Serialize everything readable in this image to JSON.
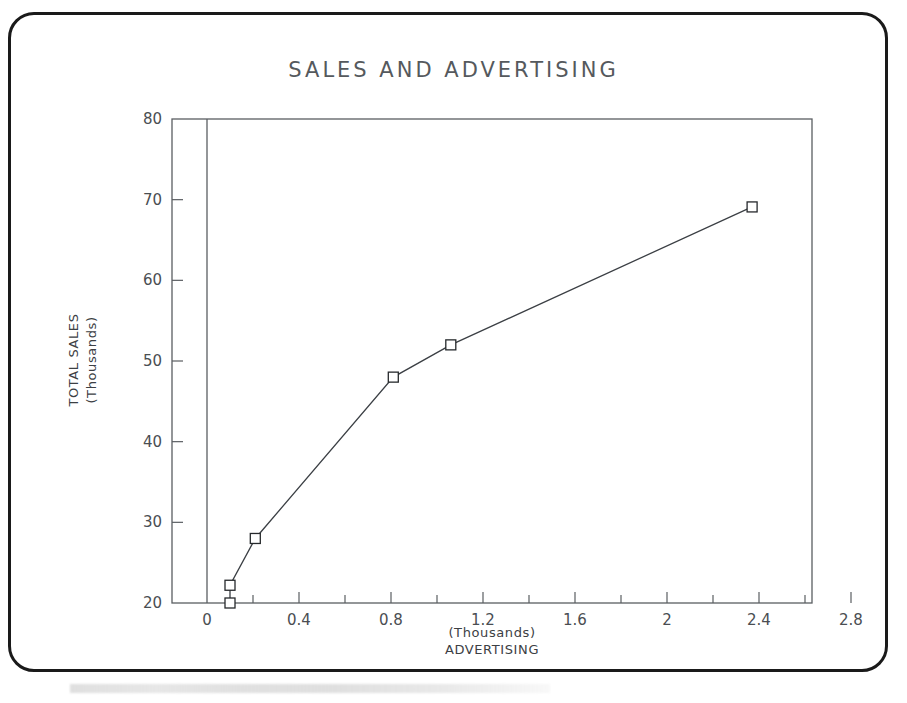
{
  "chart_data": {
    "type": "line",
    "title": "SALES AND ADVERTISING",
    "xlabel": "ADVERTISING",
    "xlabel_units": "(Thousands)",
    "ylabel": "TOTAL SALES",
    "ylabel_units": "(Thousands)",
    "xlim": [
      0,
      2.87
    ],
    "ylim": [
      20,
      80
    ],
    "x_major_ticks": [
      0,
      0.4,
      0.8,
      1.2,
      1.6,
      2,
      2.4,
      2.8
    ],
    "x_major_tick_labels": [
      "0",
      "0.4",
      "0.8",
      "1.2",
      "1.6",
      "2",
      "2.4",
      "2.8"
    ],
    "x_minor_ticks": [
      0.2,
      0.6,
      1.0,
      1.4,
      1.8,
      2.2,
      2.6
    ],
    "y_major_ticks": [
      20,
      30,
      40,
      50,
      60,
      70,
      80
    ],
    "y_major_tick_labels": [
      "20",
      "30",
      "40",
      "50",
      "60",
      "70",
      "80"
    ],
    "grid": false,
    "legend": "none",
    "marker": "open-square",
    "series": [
      {
        "name": "Total Sales",
        "x": [
          0.1,
          0.1,
          0.21,
          0.81,
          1.06,
          2.37
        ],
        "y": [
          20.0,
          22.2,
          28.0,
          48.0,
          52.0,
          69.1
        ],
        "points": [
          {
            "x": 0.1,
            "y": 20.0
          },
          {
            "x": 0.1,
            "y": 22.2
          },
          {
            "x": 0.21,
            "y": 28.0
          },
          {
            "x": 0.81,
            "y": 48.0
          },
          {
            "x": 1.06,
            "y": 52.0
          },
          {
            "x": 2.37,
            "y": 69.1
          }
        ]
      }
    ],
    "colors": {
      "line": "#3b3f44",
      "marker_fill": "#ffffff",
      "marker_stroke": "#26292c",
      "axis": "#5a5e62",
      "title": "#55595d",
      "frame": "#1a1a1a",
      "background": "#ffffff"
    }
  },
  "frame": {
    "label": "rounded-document-border"
  }
}
